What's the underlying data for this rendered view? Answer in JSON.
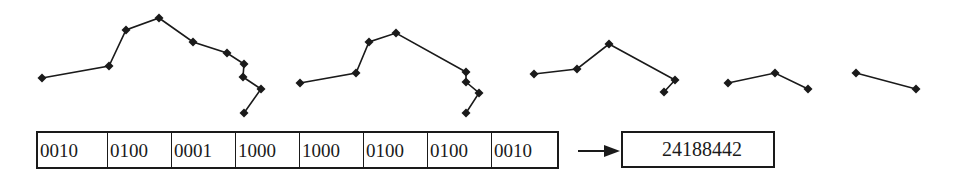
{
  "figure": {
    "colors": {
      "stroke": "#1a1a1a",
      "background": "#ffffff"
    },
    "curves": [
      {
        "name": "stage-1",
        "points": [
          [
            42,
            78
          ],
          [
            109,
            66
          ],
          [
            126,
            30
          ],
          [
            159,
            18
          ],
          [
            193,
            42
          ],
          [
            227,
            53
          ],
          [
            244,
            64
          ],
          [
            243,
            77
          ],
          [
            261,
            89
          ],
          [
            244,
            113
          ]
        ]
      },
      {
        "name": "stage-2",
        "points": [
          [
            300,
            83
          ],
          [
            356,
            73
          ],
          [
            369,
            42
          ],
          [
            396,
            33
          ],
          [
            466,
            72
          ],
          [
            466,
            82
          ],
          [
            479,
            93
          ],
          [
            466,
            113
          ]
        ]
      },
      {
        "name": "stage-3",
        "points": [
          [
            534,
            74
          ],
          [
            577,
            69
          ],
          [
            609,
            44
          ],
          [
            675,
            80
          ],
          [
            664,
            92
          ]
        ]
      },
      {
        "name": "stage-4",
        "points": [
          [
            728,
            83
          ],
          [
            775,
            73
          ],
          [
            808,
            89
          ]
        ]
      },
      {
        "name": "stage-5",
        "points": [
          [
            856,
            73
          ],
          [
            916,
            89
          ]
        ]
      }
    ],
    "code_cells": [
      {
        "label": "0010",
        "width": 70
      },
      {
        "label": "0100",
        "width": 64
      },
      {
        "label": "0001",
        "width": 64
      },
      {
        "label": "1000",
        "width": 64
      },
      {
        "label": "1000",
        "width": 64
      },
      {
        "label": "0100",
        "width": 64
      },
      {
        "label": "0100",
        "width": 64
      },
      {
        "label": "0010",
        "width": 65
      }
    ],
    "arrow": "right-arrow",
    "result": "24188442"
  }
}
